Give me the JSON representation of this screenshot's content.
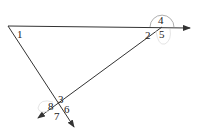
{
  "diagram": {
    "type": "angle-labels-at-intersections",
    "lines": [
      {
        "id": "horizontal-ray",
        "from": "vertex-1",
        "to": "arrow-right"
      },
      {
        "id": "descending-ray",
        "from": "vertex-1",
        "to": "arrow-bottom"
      },
      {
        "id": "transversal-ray",
        "from": "upper-right-intersection",
        "to": "arrow-lower-left"
      }
    ],
    "angle_labels": {
      "a1": "1",
      "a2": "2",
      "a3": "3",
      "a4": "4",
      "a5": "5",
      "a6": "6",
      "a7": "7",
      "a8": "8"
    },
    "colors": {
      "line": "#333333",
      "arc": "#888888",
      "label": "#222222"
    }
  }
}
